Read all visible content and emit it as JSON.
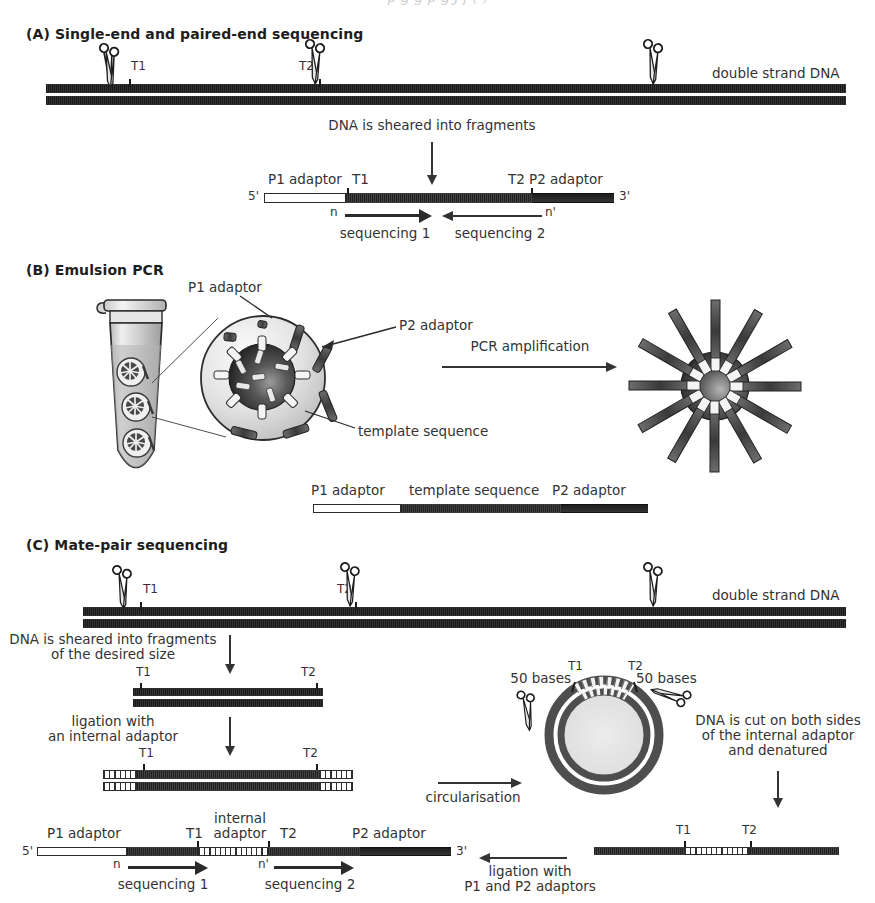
{
  "figure": {
    "top_clipped_line": "p        g      g   p        g  j        f           (  )",
    "panels": [
      {
        "id": "A",
        "label": "(A) Single-end and paired-end sequencing"
      },
      {
        "id": "B",
        "label": "(B) Emulsion PCR"
      },
      {
        "id": "C",
        "label": "(C) Mate-pair sequencing"
      }
    ]
  },
  "panel_a": {
    "title": "(A) Single-end and paired-end sequencing",
    "dna_label": "double strand DNA",
    "cut_sites": [
      "T1",
      "T2"
    ],
    "step_label": "DNA is sheared into fragments",
    "fragment": {
      "five_prime": "5'",
      "three_prime": "3'",
      "p1_label": "P1 adaptor",
      "t1_label": "T1",
      "t2_label": "T2",
      "p2_label": "P2 adaptor",
      "n_label": "n",
      "n_prime_label": "n'",
      "seq1_label": "sequencing 1",
      "seq2_label": "sequencing 2"
    }
  },
  "panel_b": {
    "title": "(B) Emulsion PCR",
    "callouts": {
      "p1_adaptor": "P1 adaptor",
      "p2_adaptor": "P2 adaptor",
      "template_sequence": "template sequence"
    },
    "process_label": "PCR amplification",
    "legend_bar": {
      "p1_label": "P1 adaptor",
      "template_label": "template sequence",
      "p2_label": "P2 adaptor"
    }
  },
  "panel_c": {
    "title": "(C) Mate-pair sequencing",
    "dna_label": "double strand DNA",
    "cut_sites": [
      "T1",
      "T2"
    ],
    "step1_label": "DNA is sheared into fragments\nof the desired size",
    "fragment1": {
      "t1": "T1",
      "t2": "T2"
    },
    "step2_label": "ligation with\nan internal adaptor",
    "fragment2": {
      "t1": "T1",
      "t2": "T2"
    },
    "circularisation_label": "circularisation",
    "circle": {
      "t1": "T1",
      "t2": "T2",
      "left_bases": "50 bases",
      "right_bases": "50 bases"
    },
    "cut_step_label": "DNA is cut on both sides\nof the internal adaptor\nand denatured",
    "linear_after_cut": {
      "t1": "T1",
      "t2": "T2"
    },
    "ligation_label": "ligation with\nP1 and P2 adaptors",
    "final_fragment": {
      "five_prime": "5'",
      "three_prime": "3'",
      "p1_label": "P1 adaptor",
      "t1_label": "T1",
      "internal_label": "internal\nadaptor",
      "t2_label": "T2",
      "p2_label": "P2 adaptor",
      "n_label": "n",
      "n_prime_label": "n'",
      "seq1_label": "sequencing 1",
      "seq2_label": "sequencing 2"
    }
  },
  "colors": {
    "ink": "#2b2b2b",
    "strand_gray": "#5d5d5d",
    "template_gray": "#6f6f6f",
    "p2_dark": "#242424",
    "p1_white": "#ffffff",
    "bead_dark": "#3a3a3a",
    "droplet_light": "#d9d9d9"
  }
}
